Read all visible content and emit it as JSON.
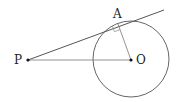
{
  "diagram": {
    "type": "geometry",
    "labels": {
      "point_a": "A",
      "point_o": "O",
      "point_p": "P"
    },
    "colors": {
      "stroke": "#555555",
      "point": "#111111",
      "text": "#222222"
    }
  }
}
